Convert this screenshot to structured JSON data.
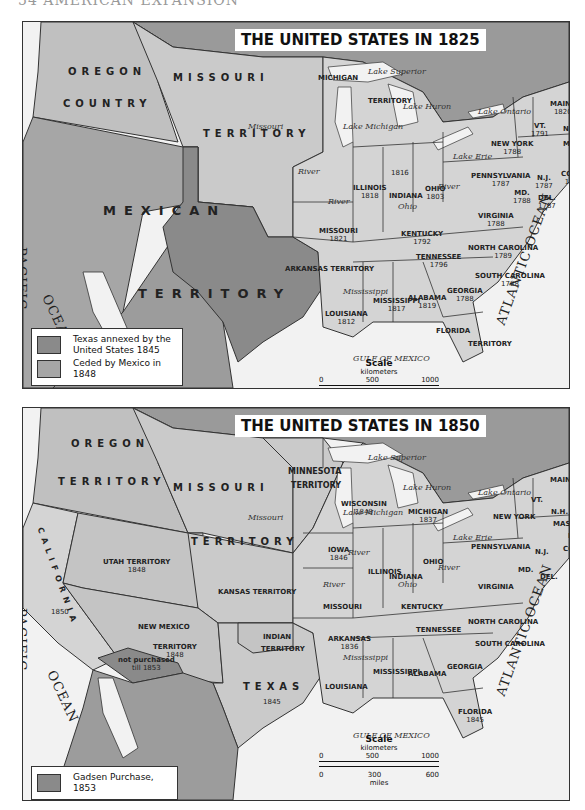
{
  "page_header": "54   AMERICAN EXPANSION",
  "colors": {
    "water": "#f2f2f2",
    "base_land": "#c8c8c8",
    "states": "#d4d4d4",
    "canada": "#9a9a9a",
    "texas_annexed": "#8a8a8a",
    "ceded_mexico": "#a6a6a6",
    "gadsden": "#8a8a8a",
    "mexico": "#9c9c9c"
  },
  "map_1825": {
    "title": "THE UNITED STATES IN 1825",
    "regions": [
      {
        "name": "OREGON",
        "x": 45,
        "y": 46
      },
      {
        "name": "COUNTRY",
        "x": 40,
        "y": 78
      },
      {
        "name": "MISSOURI",
        "x": 150,
        "y": 52
      },
      {
        "name": "TERRITORY",
        "x": 180,
        "y": 128
      },
      {
        "name": "MEXICAN",
        "x": 80,
        "y": 185
      },
      {
        "name": "TERRITORY",
        "x": 115,
        "y": 268
      }
    ],
    "states": [
      {
        "name": "MICHIGAN",
        "yr": "",
        "x": 295,
        "y": 52
      },
      {
        "name": "TERRITORY",
        "yr": "",
        "x": 345,
        "y": 75
      },
      {
        "name": "ILLINOIS",
        "yr": "1818",
        "x": 330,
        "y": 162
      },
      {
        "name": "",
        "yr": "1816",
        "x": 368,
        "y": 147
      },
      {
        "name": "INDIANA",
        "yr": "",
        "x": 366,
        "y": 170
      },
      {
        "name": "OHIO",
        "yr": "1803",
        "x": 402,
        "y": 163
      },
      {
        "name": "MISSOURI",
        "yr": "1821",
        "x": 296,
        "y": 205
      },
      {
        "name": "KENTUCKY",
        "yr": "1792",
        "x": 378,
        "y": 208
      },
      {
        "name": "VIRGINIA",
        "yr": "1788",
        "x": 455,
        "y": 190
      },
      {
        "name": "PENNSYLVANIA",
        "yr": "1787",
        "x": 448,
        "y": 150
      },
      {
        "name": "NEW YORK",
        "yr": "1788",
        "x": 468,
        "y": 118
      },
      {
        "name": "TENNESSEE",
        "yr": "1796",
        "x": 393,
        "y": 231
      },
      {
        "name": "NORTH CAROLINA",
        "yr": "1789",
        "x": 445,
        "y": 222
      },
      {
        "name": "SOUTH CAROLINA",
        "yr": "1788",
        "x": 452,
        "y": 250
      },
      {
        "name": "GEORGIA",
        "yr": "1788",
        "x": 424,
        "y": 265
      },
      {
        "name": "ALABAMA",
        "yr": "1819",
        "x": 385,
        "y": 272
      },
      {
        "name": "MISSISSIPPI",
        "yr": "1817",
        "x": 350,
        "y": 275
      },
      {
        "name": "LOUISIANA",
        "yr": "1812",
        "x": 302,
        "y": 288
      },
      {
        "name": "ARKANSAS TERRITORY",
        "yr": "",
        "x": 262,
        "y": 243
      },
      {
        "name": "FLORIDA",
        "yr": "",
        "x": 413,
        "y": 305
      },
      {
        "name": "TERRITORY",
        "yr": "",
        "x": 445,
        "y": 318
      },
      {
        "name": "MAINE",
        "yr": "1820",
        "x": 527,
        "y": 78
      },
      {
        "name": "VT.",
        "yr": "1791",
        "x": 508,
        "y": 100
      },
      {
        "name": "N.H. 1788",
        "yr": "",
        "x": 540,
        "y": 103
      },
      {
        "name": "MASS. 1788",
        "yr": "",
        "x": 540,
        "y": 118
      },
      {
        "name": "R.I. 1790",
        "yr": "",
        "x": 552,
        "y": 132
      },
      {
        "name": "CONN.",
        "yr": "1788",
        "x": 538,
        "y": 148
      },
      {
        "name": "N.J.",
        "yr": "1787",
        "x": 512,
        "y": 152
      },
      {
        "name": "MD.",
        "yr": "1788",
        "x": 490,
        "y": 167
      },
      {
        "name": "DEL.",
        "yr": "1787",
        "x": 515,
        "y": 172
      }
    ],
    "water": [
      {
        "name": "Lake Superior",
        "x": 345,
        "y": 45
      },
      {
        "name": "Lake Michigan",
        "x": 320,
        "y": 100
      },
      {
        "name": "Lake Huron",
        "x": 380,
        "y": 80
      },
      {
        "name": "Lake Ontario",
        "x": 455,
        "y": 85
      },
      {
        "name": "Lake Erie",
        "x": 430,
        "y": 130
      },
      {
        "name": "Missouri",
        "x": 225,
        "y": 100
      },
      {
        "name": "River",
        "x": 275,
        "y": 145
      },
      {
        "name": "River",
        "x": 305,
        "y": 175
      },
      {
        "name": "Ohio",
        "x": 375,
        "y": 180
      },
      {
        "name": "River",
        "x": 415,
        "y": 160
      },
      {
        "name": "Mississippi",
        "x": 320,
        "y": 265
      },
      {
        "name": "GULF   OF   MEXICO",
        "x": 330,
        "y": 332
      }
    ],
    "oceans": [
      {
        "name": "PACIFIC",
        "x": 6,
        "y": 225,
        "rotate": 90
      },
      {
        "name": "OCEAN",
        "x": 30,
        "y": 270,
        "rotate": 65
      },
      {
        "name": "ATLANTIC  OCEAN",
        "x": 470,
        "y": 300,
        "rotate": -70
      }
    ],
    "legend": [
      {
        "label": "Texas annexed by the United States 1845",
        "color": "#8a8a8a"
      },
      {
        "label": "Ceded by Mexico in 1848",
        "color": "#a6a6a6"
      }
    ],
    "scale": {
      "title": "Scale",
      "km_label": "kilometers",
      "km_ticks": [
        "0",
        "500",
        "1000"
      ],
      "mi_ticks": [
        "0",
        "300",
        "600"
      ],
      "mi_label": "miles"
    }
  },
  "map_1850": {
    "title": "THE UNITED STATES IN 1850",
    "regions": [
      {
        "name": "OREGON",
        "x": 48,
        "y": 32
      },
      {
        "name": "TERRITORY",
        "x": 35,
        "y": 70
      },
      {
        "name": "MISSOURI",
        "x": 150,
        "y": 76
      },
      {
        "name": "TERRITORY",
        "x": 168,
        "y": 130
      },
      {
        "name": "MINNESOTA",
        "x": 270,
        "y": 66,
        "small": true
      },
      {
        "name": "TERRITORY",
        "x": 275,
        "y": 90,
        "small": true
      },
      {
        "name": "CALIFORNIA",
        "x": 12,
        "y": 140,
        "small": true
      },
      {
        "name": "TEXAS",
        "x": 220,
        "y": 275
      }
    ],
    "states": [
      {
        "name": "UTAH  TERRITORY",
        "yr": "1848",
        "x": 80,
        "y": 150
      },
      {
        "name": "KANSAS TERRITORY",
        "yr": "",
        "x": 195,
        "y": 180
      },
      {
        "name": "NEW  MEXICO",
        "yr": "",
        "x": 115,
        "y": 215
      },
      {
        "name": "TERRITORY",
        "yr": "1848",
        "x": 130,
        "y": 235
      },
      {
        "name": "not purchased",
        "yr": "till 1853",
        "x": 95,
        "y": 248
      },
      {
        "name": "",
        "yr": "1850",
        "x": 28,
        "y": 200
      },
      {
        "name": "",
        "yr": "1845",
        "x": 240,
        "y": 290
      },
      {
        "name": "INDIAN",
        "yr": "",
        "x": 240,
        "y": 225
      },
      {
        "name": "TERRITORY",
        "yr": "",
        "x": 238,
        "y": 237
      },
      {
        "name": "ARKANSAS",
        "yr": "1836",
        "x": 305,
        "y": 227
      },
      {
        "name": "IOWA",
        "yr": "1846",
        "x": 305,
        "y": 138
      },
      {
        "name": "ILLINOIS",
        "yr": "",
        "x": 345,
        "y": 160
      },
      {
        "name": "MISSOURI",
        "yr": "",
        "x": 300,
        "y": 195
      },
      {
        "name": "WISCONSIN",
        "yr": "1848",
        "x": 318,
        "y": 92
      },
      {
        "name": "MICHIGAN",
        "yr": "1837",
        "x": 385,
        "y": 100
      },
      {
        "name": "INDIANA",
        "yr": "",
        "x": 366,
        "y": 165
      },
      {
        "name": "OHIO",
        "yr": "",
        "x": 400,
        "y": 150
      },
      {
        "name": "KENTUCKY",
        "yr": "",
        "x": 378,
        "y": 195
      },
      {
        "name": "VIRGINIA",
        "yr": "",
        "x": 455,
        "y": 175
      },
      {
        "name": "PENNSYLVANIA",
        "yr": "",
        "x": 448,
        "y": 135
      },
      {
        "name": "NEW YORK",
        "yr": "",
        "x": 470,
        "y": 105
      },
      {
        "name": "TENNESSEE",
        "yr": "",
        "x": 393,
        "y": 218
      },
      {
        "name": "NORTH CAROLINA",
        "yr": "",
        "x": 445,
        "y": 210
      },
      {
        "name": "SOUTH CAROLINA",
        "yr": "",
        "x": 452,
        "y": 232
      },
      {
        "name": "GEORGIA",
        "yr": "",
        "x": 424,
        "y": 255
      },
      {
        "name": "ALABAMA",
        "yr": "",
        "x": 385,
        "y": 262
      },
      {
        "name": "MISSISSIPPI",
        "yr": "",
        "x": 350,
        "y": 260
      },
      {
        "name": "LOUISIANA",
        "yr": "",
        "x": 302,
        "y": 275
      },
      {
        "name": "FLORIDA",
        "yr": "1845",
        "x": 435,
        "y": 300
      },
      {
        "name": "MAINE",
        "yr": "",
        "x": 527,
        "y": 68
      },
      {
        "name": "VT.",
        "yr": "",
        "x": 508,
        "y": 88
      },
      {
        "name": "N.H.",
        "yr": "",
        "x": 528,
        "y": 100
      },
      {
        "name": "MASS.",
        "yr": "",
        "x": 530,
        "y": 112
      },
      {
        "name": "R.I.",
        "yr": "",
        "x": 545,
        "y": 124
      },
      {
        "name": "CONN.",
        "yr": "",
        "x": 540,
        "y": 137
      },
      {
        "name": "N.J.",
        "yr": "",
        "x": 512,
        "y": 140
      },
      {
        "name": "MD.",
        "yr": "",
        "x": 495,
        "y": 158
      },
      {
        "name": "DEL.",
        "yr": "",
        "x": 517,
        "y": 165
      }
    ],
    "water": [
      {
        "name": "Lake Superior",
        "x": 345,
        "y": 45
      },
      {
        "name": "Lake Michigan",
        "x": 320,
        "y": 100
      },
      {
        "name": "Lake Huron",
        "x": 380,
        "y": 75
      },
      {
        "name": "Lake Ontario",
        "x": 455,
        "y": 80
      },
      {
        "name": "Lake Erie",
        "x": 430,
        "y": 125
      },
      {
        "name": "Missouri",
        "x": 225,
        "y": 105
      },
      {
        "name": "River",
        "x": 325,
        "y": 140
      },
      {
        "name": "River",
        "x": 300,
        "y": 172
      },
      {
        "name": "Ohio",
        "x": 375,
        "y": 172
      },
      {
        "name": "River",
        "x": 415,
        "y": 155
      },
      {
        "name": "Mississippi",
        "x": 320,
        "y": 245
      },
      {
        "name": "GULF   OF   MEXICO",
        "x": 330,
        "y": 323
      }
    ],
    "oceans": [
      {
        "name": "PACIFIC",
        "x": 6,
        "y": 200,
        "rotate": 90
      },
      {
        "name": "OCEAN",
        "x": 35,
        "y": 260,
        "rotate": 65
      },
      {
        "name": "ATLANTIC  OCEAN",
        "x": 470,
        "y": 285,
        "rotate": -70
      }
    ],
    "legend": [
      {
        "label": "Gadsen Purchase, 1853",
        "color": "#8a8a8a"
      }
    ],
    "scale": {
      "title": "Scale",
      "km_label": "kilometers",
      "km_ticks": [
        "0",
        "500",
        "1000"
      ],
      "mi_ticks": [
        "0",
        "300",
        "600"
      ],
      "mi_label": "miles"
    }
  }
}
